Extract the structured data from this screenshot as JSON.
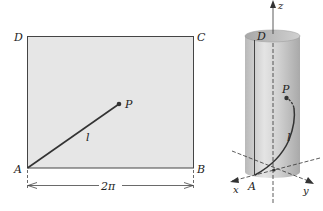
{
  "figure": {
    "left_panel": {
      "description": "Flat rectangle ABCD with line segment l from A to P",
      "vertices": {
        "A": "A",
        "B": "B",
        "C": "C",
        "D": "D"
      },
      "point_label": "P",
      "segment_label": "l",
      "width_label": "2π",
      "fill_color": "#e6e6e6",
      "stroke_color": "#333333"
    },
    "right_panel": {
      "description": "Rectangle rolled into a cylinder; segment l becomes a helix arc from A to P",
      "axis_labels": {
        "x": "x",
        "y": "y",
        "z": "z"
      },
      "top_label": "D",
      "base_label": "A",
      "point_label": "P",
      "curve_label": "l",
      "cylinder_color": "#c8c8c8"
    }
  }
}
